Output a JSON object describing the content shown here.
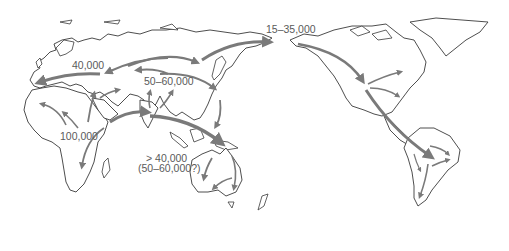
{
  "map": {
    "title": "Human migration routes out of Africa",
    "colors": {
      "background": "#ffffff",
      "coastline": "#3a3a3a",
      "arrow": "#7a7a7a",
      "label": "#5a5a5a"
    },
    "labels": [
      {
        "id": "europe",
        "text": "40,000",
        "x": 72,
        "y": 60
      },
      {
        "id": "asia",
        "text": "50–60,000",
        "x": 144,
        "y": 76
      },
      {
        "id": "africa",
        "text": "100,000",
        "x": 60,
        "y": 134
      },
      {
        "id": "beringia",
        "text": "15–35,000",
        "x": 266,
        "y": 24
      },
      {
        "id": "australia_1",
        "text": "> 40,000",
        "x": 145,
        "y": 155
      },
      {
        "id": "australia_2",
        "text": "(50–60,000?)",
        "x": 138,
        "y": 165
      }
    ],
    "routes": [
      {
        "from": "East Africa",
        "to": "West Africa"
      },
      {
        "from": "East Africa",
        "to": "Southern Africa"
      },
      {
        "from": "East Africa",
        "to": "Middle East"
      },
      {
        "from": "Middle East",
        "to": "Europe"
      },
      {
        "from": "Arabia",
        "to": "India / Southeast Asia"
      },
      {
        "from": "Central Asia",
        "to": "Europe"
      },
      {
        "from": "Central Asia",
        "to": "East Asia"
      },
      {
        "from": "South Asia",
        "to": "Central Asia"
      },
      {
        "from": "East Asia",
        "to": "Australia"
      },
      {
        "from": "Siberia",
        "to": "Beringia"
      },
      {
        "from": "Beringia",
        "to": "North America"
      },
      {
        "from": "North America",
        "to": "South America"
      }
    ]
  }
}
